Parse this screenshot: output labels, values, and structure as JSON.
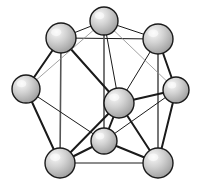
{
  "figure": {
    "kind": "molecular-cluster-diagram",
    "title": "",
    "caption": "",
    "background_color": "#ffffff",
    "line_color_dark": "#1a1a1a",
    "line_color_mid": "#555555",
    "line_color_light": "#8a8a8a",
    "sphere_fill_light": "#efefef",
    "sphere_fill_mid": "#bdbdbd",
    "sphere_fill_dark": "#9a9a9a",
    "sphere_outline": "#1a1a1a",
    "stipple_color": "#6b6b6b",
    "node_count": 8,
    "edge_count": 20
  },
  "nodes": [
    {
      "id": "top-apex",
      "label": "",
      "cx": 104,
      "cy": 21,
      "r": 14,
      "depth": "front"
    },
    {
      "id": "top-left",
      "label": "",
      "cx": 61,
      "cy": 38,
      "r": 15,
      "depth": "front"
    },
    {
      "id": "top-right",
      "label": "",
      "cx": 158,
      "cy": 39,
      "r": 15,
      "depth": "front"
    },
    {
      "id": "left",
      "label": "",
      "cx": 26,
      "cy": 89,
      "r": 14,
      "depth": "front"
    },
    {
      "id": "right",
      "label": "",
      "cx": 176,
      "cy": 90,
      "r": 13,
      "depth": "back"
    },
    {
      "id": "center",
      "label": "",
      "cx": 119,
      "cy": 103,
      "r": 15,
      "depth": "front"
    },
    {
      "id": "bottom-center",
      "label": "",
      "cx": 104,
      "cy": 141,
      "r": 13,
      "depth": "back"
    },
    {
      "id": "bottom-left",
      "label": "",
      "cx": 60,
      "cy": 163,
      "r": 15,
      "depth": "front"
    },
    {
      "id": "bottom-right",
      "label": "",
      "cx": 158,
      "cy": 163,
      "r": 15,
      "depth": "front"
    }
  ],
  "edges": [
    {
      "from": "top-left",
      "to": "top-apex",
      "weight": "thin"
    },
    {
      "from": "top-apex",
      "to": "top-right",
      "weight": "thin"
    },
    {
      "from": "top-left",
      "to": "top-right",
      "weight": "thin"
    },
    {
      "from": "top-left",
      "to": "left",
      "weight": "thick"
    },
    {
      "from": "top-right",
      "to": "right",
      "weight": "thick"
    },
    {
      "from": "top-left",
      "to": "bottom-left",
      "weight": "vert"
    },
    {
      "from": "top-right",
      "to": "bottom-right",
      "weight": "vert"
    },
    {
      "from": "top-apex",
      "to": "bottom-center",
      "weight": "vert"
    },
    {
      "from": "top-left",
      "to": "center",
      "weight": "thick"
    },
    {
      "from": "top-apex",
      "to": "center",
      "weight": "thin"
    },
    {
      "from": "top-right",
      "to": "center",
      "weight": "thin"
    },
    {
      "from": "center",
      "to": "right",
      "weight": "thick"
    },
    {
      "from": "center",
      "to": "bottom-center",
      "weight": "thick"
    },
    {
      "from": "center",
      "to": "bottom-left",
      "weight": "thick"
    },
    {
      "from": "center",
      "to": "bottom-right",
      "weight": "thick"
    },
    {
      "from": "left",
      "to": "bottom-left",
      "weight": "thick"
    },
    {
      "from": "left",
      "to": "bottom-center",
      "weight": "thin"
    },
    {
      "from": "right",
      "to": "bottom-right",
      "weight": "thick"
    },
    {
      "from": "right",
      "to": "bottom-center",
      "weight": "thin"
    },
    {
      "from": "bottom-left",
      "to": "bottom-center",
      "weight": "thick"
    },
    {
      "from": "bottom-center",
      "to": "bottom-right",
      "weight": "thick"
    },
    {
      "from": "bottom-left",
      "to": "bottom-right",
      "weight": "thin"
    },
    {
      "from": "left",
      "to": "top-apex",
      "weight": "light"
    },
    {
      "from": "right",
      "to": "top-apex",
      "weight": "light"
    }
  ]
}
